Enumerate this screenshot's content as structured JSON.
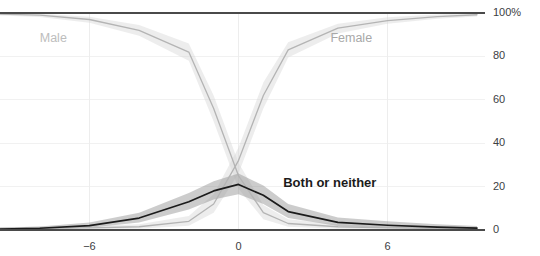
{
  "chart_data": {
    "type": "line",
    "title": "",
    "xlabel": "",
    "ylabel": "",
    "xlim": [
      -9.6,
      9.6
    ],
    "ylim": [
      0,
      100
    ],
    "grid": true,
    "y_ticks": [
      0,
      20,
      40,
      60,
      80,
      100
    ],
    "y_tick_labels": [
      "0",
      "20",
      "40",
      "60",
      "80",
      "100%"
    ],
    "x_ticks": [
      -6,
      0,
      6
    ],
    "x_tick_labels": [
      "−6",
      "0",
      "6"
    ],
    "legend_position": "inline-annotations",
    "band_type": "confidence interval",
    "x": [
      -9.6,
      -8,
      -6,
      -4,
      -2,
      -1,
      0,
      1,
      2,
      4,
      6,
      8,
      9.6
    ],
    "series": [
      {
        "name": "Male",
        "color": "#b4b4b4",
        "band_color": "#d8d8d8",
        "values": [
          99.5,
          99.0,
          97.0,
          92.0,
          82.0,
          56.0,
          25.0,
          8.0,
          3.0,
          1.5,
          1.0,
          0.8,
          0.7
        ],
        "band_low": [
          98.8,
          98.2,
          95.5,
          89.5,
          78.0,
          50.0,
          19.0,
          5.0,
          1.5,
          0.6,
          0.3,
          0.2,
          0.2
        ],
        "band_high": [
          100.0,
          99.6,
          98.3,
          94.5,
          86.0,
          62.0,
          31.0,
          11.5,
          5.0,
          2.6,
          1.8,
          1.5,
          1.4
        ]
      },
      {
        "name": "Female",
        "color": "#b4b4b4",
        "band_color": "#d8d8d8",
        "values": [
          0.7,
          0.8,
          1.0,
          1.5,
          4.0,
          12.0,
          32.0,
          62.0,
          83.0,
          93.0,
          96.5,
          98.3,
          99.2
        ],
        "band_low": [
          0.2,
          0.2,
          0.3,
          0.6,
          2.0,
          8.0,
          26.0,
          56.0,
          79.5,
          90.5,
          95.0,
          97.3,
          98.4
        ],
        "band_high": [
          1.4,
          1.5,
          1.8,
          2.7,
          6.5,
          16.5,
          38.0,
          68.0,
          86.5,
          95.0,
          98.0,
          99.3,
          100.0
        ]
      },
      {
        "name": "Both or neither",
        "color": "#1b1b1b",
        "band_color": "#8e8e8e",
        "values": [
          0.4,
          0.8,
          2.0,
          5.5,
          13.0,
          18.0,
          21.0,
          16.0,
          8.5,
          3.5,
          2.2,
          1.3,
          0.9
        ],
        "band_low": [
          0.1,
          0.3,
          1.0,
          3.5,
          9.5,
          14.0,
          16.5,
          12.0,
          5.5,
          1.8,
          0.9,
          0.4,
          0.2
        ],
        "band_high": [
          1.0,
          1.6,
          3.4,
          8.0,
          17.0,
          22.5,
          26.0,
          20.5,
          12.0,
          5.8,
          4.0,
          2.6,
          1.9
        ]
      }
    ],
    "annotations": [
      {
        "name": "Male",
        "text": "Male",
        "x": -8.0,
        "y": 88.0
      },
      {
        "name": "Female",
        "text": "Female",
        "x": 3.7,
        "y": 88.0
      },
      {
        "name": "Both or neither",
        "text": "Both or neither",
        "x": 1.8,
        "y": 21.5
      }
    ]
  },
  "cropped_header": {
    "text": " "
  }
}
